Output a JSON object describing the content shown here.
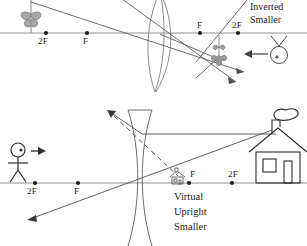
{
  "figure": {
    "title_hidden": "",
    "background": "#ffffff",
    "ink": "#1d1d1d",
    "axis_color": "#8a8a8a"
  },
  "diagrams": [
    {
      "id": "converging-lens-diagram",
      "lens_type": "convex-converging-lens",
      "object_name": "flower-object",
      "observer_name": "eye-observer",
      "image_name": "inverted-flower-image",
      "axis_labels": [
        {
          "text": "2F",
          "x": 42,
          "y": 40
        },
        {
          "text": "F",
          "x": 84,
          "y": 40
        },
        {
          "text": "F",
          "x": 197,
          "y": 25
        },
        {
          "text": "2F",
          "x": 233,
          "y": 25
        }
      ],
      "axis_points": [
        {
          "x": 46,
          "y": 33
        },
        {
          "x": 87,
          "y": 33
        },
        {
          "x": 200,
          "y": 33
        },
        {
          "x": 238,
          "y": 33
        }
      ],
      "description_lines": [
        "Inverted",
        "Smaller"
      ],
      "description_x": 252,
      "description_y": 2
    },
    {
      "id": "diverging-lens-diagram",
      "lens_type": "concave-diverging-lens",
      "object_name": "house-object",
      "observer_name": "stick-figure-observer",
      "image_name": "virtual-house-image",
      "axis_labels": [
        {
          "text": "2F",
          "x": 29,
          "y": 188
        },
        {
          "text": "F",
          "x": 73,
          "y": 188
        },
        {
          "text": "F",
          "x": 186,
          "y": 170
        },
        {
          "text": "2F",
          "x": 225,
          "y": 170
        }
      ],
      "axis_points": [
        {
          "x": 35,
          "y": 183
        },
        {
          "x": 78,
          "y": 183
        },
        {
          "x": 189,
          "y": 183
        },
        {
          "x": 232,
          "y": 183
        }
      ],
      "description_lines": [
        "Virtual",
        "Upright",
        "Smaller"
      ],
      "description_x": 174,
      "description_y": 192
    }
  ]
}
